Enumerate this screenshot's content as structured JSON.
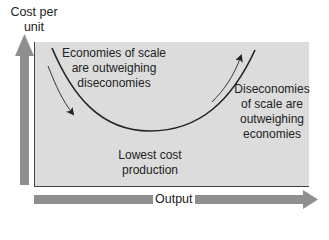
{
  "diagram": {
    "type": "cost_curve",
    "axes": {
      "y_label": "Cost per unit",
      "x_label": "Output"
    },
    "curve": {
      "shape": "U-shaped long-run average cost curve",
      "points": [
        [
          52,
          48
        ],
        [
          150,
          131
        ],
        [
          255,
          50
        ]
      ]
    },
    "annotations": {
      "left": "Economies of scale are outweighing diseconomies",
      "right": "Diseconomies of scale are outweighing economies",
      "bottom": "Lowest cost production"
    },
    "arrows": [
      {
        "name": "falling-cost-arrow",
        "direction": "down-right"
      },
      {
        "name": "rising-cost-arrow",
        "direction": "up-right"
      }
    ],
    "colors": {
      "box_fill": "#dcdcdc",
      "axis_arrow": "#8f8f8f",
      "curve": "#222222",
      "border": "#444444"
    }
  }
}
